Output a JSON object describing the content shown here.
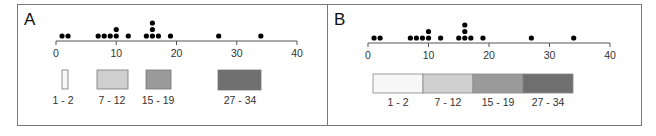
{
  "chart_data": [
    {
      "type": "scatter",
      "title": "A",
      "description": "Dot plot of 16 values on a 0-40 axis with separate legend boxes for grouped ranges",
      "values": [
        1,
        2,
        7,
        8,
        9,
        10,
        10,
        12,
        15,
        16,
        16,
        16,
        17,
        19,
        27,
        34
      ],
      "xticks": [
        0,
        10,
        20,
        30,
        40
      ],
      "xlim": [
        0,
        40
      ],
      "legend": [
        {
          "label": "1 - 2",
          "color": "#f7f7f7",
          "style": "narrow box"
        },
        {
          "label": "7 - 12",
          "color": "#cfcfcf",
          "style": "box"
        },
        {
          "label": "15 - 19",
          "color": "#9a9a9a",
          "style": "box"
        },
        {
          "label": "27 - 34",
          "color": "#6f6f6f",
          "style": "wide box"
        }
      ]
    },
    {
      "type": "scatter",
      "title": "B",
      "description": "Same dot plot with a contiguous equal-width legend bar",
      "values": [
        1,
        2,
        7,
        8,
        9,
        10,
        10,
        12,
        15,
        16,
        16,
        16,
        17,
        19,
        27,
        34
      ],
      "xticks": [
        0,
        10,
        20,
        30,
        40
      ],
      "xlim": [
        0,
        40
      ],
      "legend": [
        {
          "label": "1 - 2",
          "color": "#f7f7f7"
        },
        {
          "label": "7 - 12",
          "color": "#cfcfcf"
        },
        {
          "label": "15 - 19",
          "color": "#9a9a9a"
        },
        {
          "label": "27 - 34",
          "color": "#6f6f6f"
        }
      ]
    }
  ],
  "panels": {
    "a": {
      "label": "A"
    },
    "b": {
      "label": "B"
    }
  }
}
